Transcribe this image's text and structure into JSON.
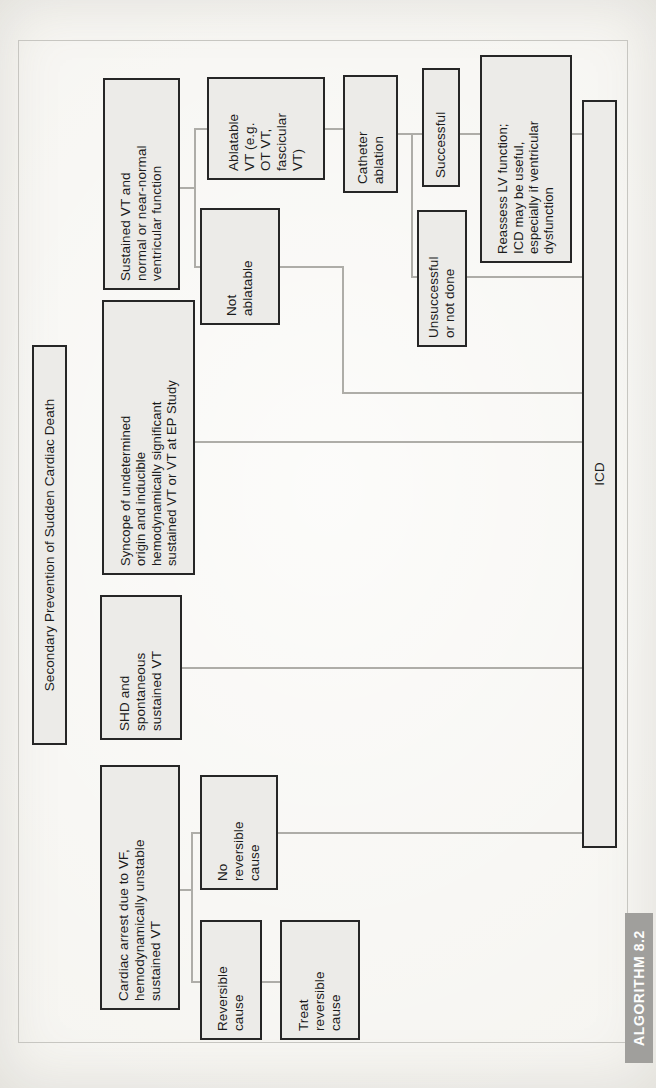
{
  "figure": {
    "title": "Secondary Prevention of Sudden Cardiac Death",
    "algorithm_label": "ALGORITHM 8.2",
    "orientation": "rotated-90-ccw"
  },
  "nodes": {
    "cardiac_arrest": {
      "text": "Cardiac arrest due to VF,\nhemodynamically unstable\nsustained VT"
    },
    "shd": {
      "text": "SHD and\nspontaneous\nsustained VT"
    },
    "syncope": {
      "text": "Syncope of undetermined\norigin and inducible\nhemodynamically significant\nsustained VT or VT at EP Study"
    },
    "sustained_vt": {
      "text": "Sustained VT and\nnormal or near-normal\nventricular function"
    },
    "reversible_cause": {
      "text": "Reversible\ncause"
    },
    "treat_reversible": {
      "text": "Treat\nreversible\ncause"
    },
    "no_reversible": {
      "text": "No\nreversible\ncause"
    },
    "not_ablatable": {
      "text": "Not\nablatable"
    },
    "ablatable": {
      "text": "Ablatable\nVT (e.g.\nOT VT,\nfascicular\nVT)"
    },
    "catheter_ablation": {
      "text": "Catheter\nablation"
    },
    "unsuccessful": {
      "text": "Unsuccessful\nor not done"
    },
    "successful": {
      "text": "Successful"
    },
    "reassess": {
      "text": "Reassess LV function;\nICD may be useful,\nespecially if ventricular\ndysfunction"
    },
    "icd": {
      "text": "ICD"
    }
  },
  "edges": [
    {
      "from": "cardiac_arrest",
      "to": "reversible_cause"
    },
    {
      "from": "cardiac_arrest",
      "to": "no_reversible"
    },
    {
      "from": "reversible_cause",
      "to": "treat_reversible"
    },
    {
      "from": "no_reversible",
      "to": "icd"
    },
    {
      "from": "shd",
      "to": "icd"
    },
    {
      "from": "syncope",
      "to": "icd"
    },
    {
      "from": "sustained_vt",
      "to": "not_ablatable"
    },
    {
      "from": "sustained_vt",
      "to": "ablatable"
    },
    {
      "from": "not_ablatable",
      "to": "icd"
    },
    {
      "from": "ablatable",
      "to": "catheter_ablation"
    },
    {
      "from": "catheter_ablation",
      "to": "unsuccessful"
    },
    {
      "from": "catheter_ablation",
      "to": "successful"
    },
    {
      "from": "unsuccessful",
      "to": "icd"
    },
    {
      "from": "successful",
      "to": "reassess"
    },
    {
      "from": "reassess",
      "to": "icd"
    }
  ],
  "colors": {
    "node_fill": "#ecebe8",
    "node_border": "#262626",
    "edge_line": "#aeada8",
    "page_background": "#f6f5f1",
    "frame_line": "#c7c6c1",
    "algorithm_tab_fill": "#a09f9c",
    "algorithm_tab_text": "#fdfdfc"
  }
}
